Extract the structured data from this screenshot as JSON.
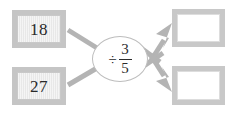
{
  "diagram": {
    "type": "function-machine",
    "title": "",
    "inputs": [
      {
        "id": "input-1",
        "value": "18",
        "filled": true
      },
      {
        "id": "input-2",
        "value": "27",
        "filled": true
      }
    ],
    "operator": {
      "sign": "÷",
      "sign_name": "division-sign",
      "operand_type": "fraction",
      "numerator": "3",
      "denominator": "5",
      "expression": "÷ 3/5"
    },
    "outputs": [
      {
        "id": "output-1",
        "value": "",
        "filled": false
      },
      {
        "id": "output-2",
        "value": "",
        "filled": false
      }
    ],
    "arrows": [
      {
        "id": "arrow-in-1",
        "from": "input-1",
        "to": "operator",
        "arrowhead": false
      },
      {
        "id": "arrow-in-2",
        "from": "input-2",
        "to": "operator",
        "arrowhead": false
      },
      {
        "id": "arrow-out-1",
        "from": "operator",
        "to": "output-1",
        "arrowhead": true
      },
      {
        "id": "arrow-out-2",
        "from": "operator",
        "to": "output-2",
        "arrowhead": true
      }
    ],
    "colors": {
      "arrow": "#b4b4b4",
      "box_border": "#c6c6c6",
      "input_fill": "#e8e8e8",
      "output_fill": "#ffffff",
      "oval_border": "#bdbdbd",
      "text": "#2a2a2a",
      "background": "#ffffff"
    }
  }
}
